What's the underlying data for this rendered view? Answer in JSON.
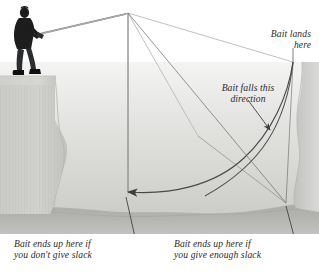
{
  "figure": {
    "background_color": "#ffffff",
    "water_color": "#d9dad7",
    "rock_color": "#c9cac6",
    "floor_color": "#b4b5b0",
    "line_color": "#4a4a4a",
    "faint_line_color": "#b9bab8",
    "text_color": "#2b2b2b"
  },
  "captions": {
    "bait_lands_here": "Bait lands\nhere",
    "bait_falls_direction": "Bait falls this\ndirection",
    "ends_up_no_slack": "Bait ends up here if\nyou don't give slack",
    "ends_up_enough_slack": "Bait ends up here if\nyou give enough slack"
  },
  "elements": {
    "angler_label": "angler standing on cliff edge",
    "rod_label": "fishing rod",
    "left_cliff_label": "left cliff wall",
    "right_cliff_label": "right cliff wall",
    "seabed_label": "sea floor",
    "taut_line_label": "taut line path",
    "slack_curve_label": "slack line bait curve",
    "drop_line_label": "vertical drop line",
    "landing_point_label": "bait landing point"
  }
}
